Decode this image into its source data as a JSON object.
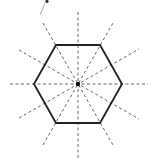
{
  "figure": {
    "shape": "regular-hexagon",
    "symmetry_line_count": 6,
    "colors": {
      "background": "#ffffff",
      "hexagon_stroke": "#222222",
      "symmetry_lines": "#555555",
      "center_point": "#111111"
    },
    "center": [
      78,
      84
    ],
    "hexagon_vertices": [
      [
        122,
        84
      ],
      [
        100,
        45
      ],
      [
        56,
        45
      ],
      [
        34,
        84
      ],
      [
        56,
        123
      ],
      [
        100,
        123
      ]
    ],
    "symmetry_lines": [
      {
        "name": "horizontal-through-vertices",
        "angle_deg": 0,
        "from": [
          10,
          84
        ],
        "to": [
          148,
          84
        ]
      },
      {
        "name": "diagonal-through-vertices-60",
        "angle_deg": 60,
        "from": [
          43,
          145
        ],
        "to": [
          113,
          23
        ]
      },
      {
        "name": "diagonal-through-vertices-120",
        "angle_deg": 120,
        "from": [
          43,
          23
        ],
        "to": [
          113,
          145
        ]
      },
      {
        "name": "vertical-through-edge-midpoints",
        "angle_deg": 90,
        "from": [
          78,
          12
        ],
        "to": [
          78,
          158
        ]
      },
      {
        "name": "diagonal-through-edge-midpoints-30",
        "angle_deg": 30,
        "from": [
          19,
          118
        ],
        "to": [
          139,
          49
        ]
      },
      {
        "name": "diagonal-through-edge-midpoints-150",
        "angle_deg": 150,
        "from": [
          19,
          50
        ],
        "to": [
          139,
          119
        ]
      }
    ]
  }
}
